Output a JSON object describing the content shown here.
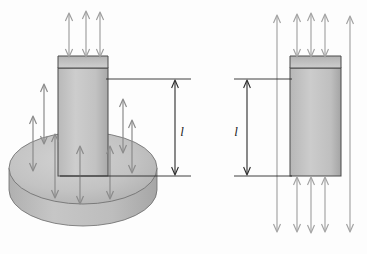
{
  "figure": {
    "background_color": "#fdfdfd",
    "ink_color": "#2b2b2b",
    "arrow_color_light": "#a8a8a8",
    "arrow_color_dark": "#8a8a8a",
    "body_fill_light": "#c9c9c9",
    "body_fill_mid": "#bdbdbd",
    "body_fill_dark": "#ababab",
    "outline_color": "#555555"
  },
  "left_figure": {
    "name": "cylindrical-base-with-column",
    "disk": {
      "label": "base-disk",
      "center_x": 83,
      "center_y": 168,
      "radius_x": 74,
      "radius_y": 36,
      "thickness": 42
    },
    "column": {
      "label": "column",
      "x": 58,
      "y": 68,
      "width": 50,
      "height": 108,
      "top_face_depth": 12
    },
    "dimension": {
      "label": "l",
      "line_x": 175,
      "top_y": 79,
      "bottom_y": 176,
      "label_x": 182,
      "label_y": 131
    },
    "top_arrows": {
      "label": "top-surface-traction-arrows",
      "count": 3,
      "x_positions": [
        69,
        87,
        100
      ],
      "tip_y": 12,
      "base_y": 68,
      "double_headed": true
    },
    "disk_arrows": {
      "label": "disk-surface-traction-arrows",
      "count": 7,
      "x_positions": [
        33,
        43,
        55,
        79,
        110,
        123,
        132
      ],
      "double_headed": true
    }
  },
  "right_figure": {
    "name": "free-rectangular-block",
    "block": {
      "label": "block",
      "x": 290,
      "y": 68,
      "width": 51,
      "height": 108,
      "top_face_depth": 12
    },
    "dimension": {
      "label": "l",
      "line_x": 247,
      "top_y": 79,
      "bottom_y": 176,
      "label_x": 236,
      "label_y": 131
    },
    "top_arrows": {
      "label": "top-surface-traction-arrows",
      "count": 5,
      "x_positions": [
        277,
        297,
        311,
        325,
        348
      ],
      "tip_y": 14,
      "double_headed": true
    },
    "bottom_arrows": {
      "label": "bottom-surface-traction-arrows",
      "count": 5,
      "x_positions": [
        277,
        297,
        311,
        325,
        348
      ],
      "tip_y": 232,
      "double_headed": true
    }
  }
}
